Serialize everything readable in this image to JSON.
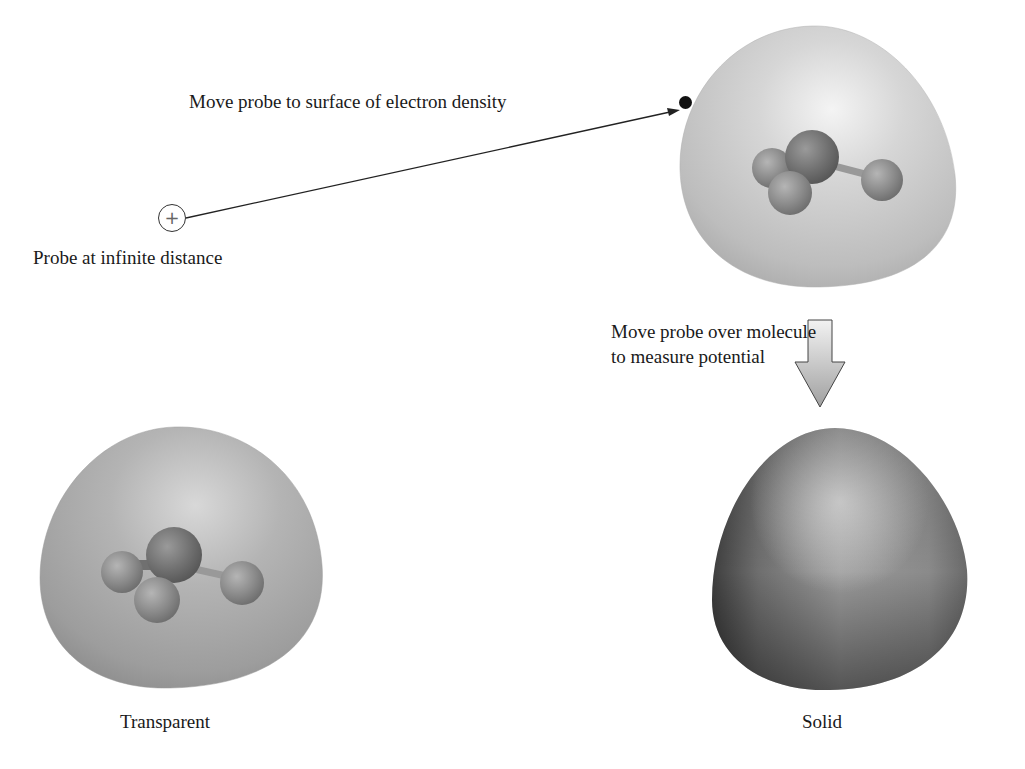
{
  "diagram": {
    "labels": {
      "move_to_surface": "Move probe to surface of electron density",
      "probe_infinite": "Probe at infinite distance",
      "move_over_line1": "Move probe over molecule",
      "move_over_line2": "to measure potential",
      "transparent": "Transparent",
      "solid": "Solid"
    },
    "probe": {
      "symbol": "+",
      "icon": "positive-charge-icon"
    },
    "surfaces": [
      {
        "id": "density-surface-top",
        "style": "translucent light gray",
        "shows_molecule": true
      },
      {
        "id": "potential-surface-transparent",
        "style": "translucent gray",
        "shows_molecule": true
      },
      {
        "id": "potential-surface-solid",
        "style": "opaque shaded gray",
        "shows_molecule": false
      }
    ],
    "molecule": {
      "atoms": 4,
      "description": "ball-and-stick molecule with one central atom and three outer atoms"
    },
    "colors": {
      "text": "#1a1a1a",
      "arrow": "#222222",
      "surface_light": "#d6d6d6",
      "surface_mid": "#a8a8a8",
      "surface_dark": "#555555",
      "atom": "#8a8a8a",
      "down_arrow_fill": "#d0d0d0"
    }
  }
}
